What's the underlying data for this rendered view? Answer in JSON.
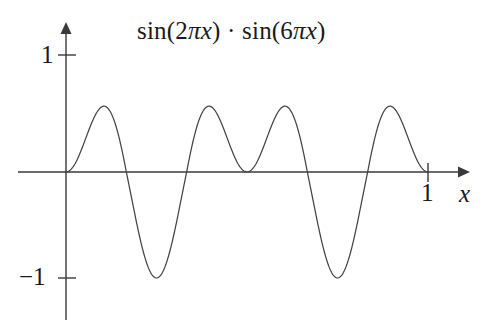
{
  "figure": {
    "title": "sin(2πx) · sin(6πx)",
    "background_color": "#ffffff",
    "curve_color": "#444444",
    "axis_color": "#3a3a3a"
  },
  "labels": {
    "y_tick_positive": "1",
    "y_tick_negative": "−1",
    "x_tick_one": "1",
    "x_axis_name": "x"
  },
  "chart_data": {
    "type": "line",
    "title": "sin(2πx) · sin(6πx)",
    "expression": "sin(2*pi*x) * sin(6*pi*x)",
    "xlabel": "x",
    "ylabel": "",
    "xlim": [
      -0.02,
      1.1
    ],
    "ylim": [
      -1.15,
      1.15
    ],
    "grid": false,
    "legend": null,
    "x_ticks": [
      1
    ],
    "x_tick_labels": [
      "1"
    ],
    "y_ticks": [
      1,
      -1
    ],
    "y_tick_labels": [
      "1",
      "−1"
    ],
    "axis_style": "arrowed-cross-axes",
    "samples": 601,
    "x_domain": [
      0,
      1
    ],
    "key_points": {
      "zeros": [
        0,
        0.1667,
        0.3333,
        0.5,
        0.6667,
        0.8333,
        1
      ],
      "maxima": [
        {
          "x": 0.103,
          "y": 0.601
        },
        {
          "x": 0.397,
          "y": 0.601
        },
        {
          "x": 0.603,
          "y": 0.601
        },
        {
          "x": 0.897,
          "y": 0.601
        }
      ],
      "minima": [
        {
          "x": 0.25,
          "y": -1.0
        },
        {
          "x": 0.75,
          "y": -1.0
        }
      ]
    },
    "series": [
      {
        "name": "sin(2πx)·sin(6πx)",
        "color": "#444444",
        "x": [
          0,
          0.02,
          0.04,
          0.06,
          0.08,
          0.1,
          0.12,
          0.14,
          0.16,
          0.18,
          0.2,
          0.22,
          0.24,
          0.26,
          0.28,
          0.3,
          0.32,
          0.34,
          0.36,
          0.38,
          0.4,
          0.42,
          0.44,
          0.46,
          0.48,
          0.5,
          0.52,
          0.54,
          0.56,
          0.58,
          0.6,
          0.62,
          0.64,
          0.66,
          0.68,
          0.7,
          0.72,
          0.74,
          0.76,
          0.78,
          0.8,
          0.82,
          0.84,
          0.86,
          0.88,
          0.9,
          0.92,
          0.94,
          0.96,
          0.98,
          1.0
        ],
        "y": [
          0.0,
          0.045,
          0.163,
          0.325,
          0.494,
          0.637,
          0.727,
          0.751,
          0.706,
          0.603,
          0.461,
          0.301,
          0.146,
          0.01,
          -0.101,
          -0.188,
          -0.257,
          -0.317,
          -0.377,
          -0.441,
          -0.511,
          -0.582,
          -0.644,
          -0.689,
          -0.711,
          -0.707,
          -0.678,
          -0.628,
          -0.564,
          -0.492,
          -0.42,
          -0.352,
          -0.29,
          -0.231,
          -0.17,
          -0.1,
          -0.013,
          0.096,
          0.229,
          0.38,
          0.537,
          0.679,
          0.782,
          0.826,
          0.8,
          0.705,
          0.554,
          0.37,
          0.184,
          0.033,
          0.0
        ]
      }
    ]
  }
}
